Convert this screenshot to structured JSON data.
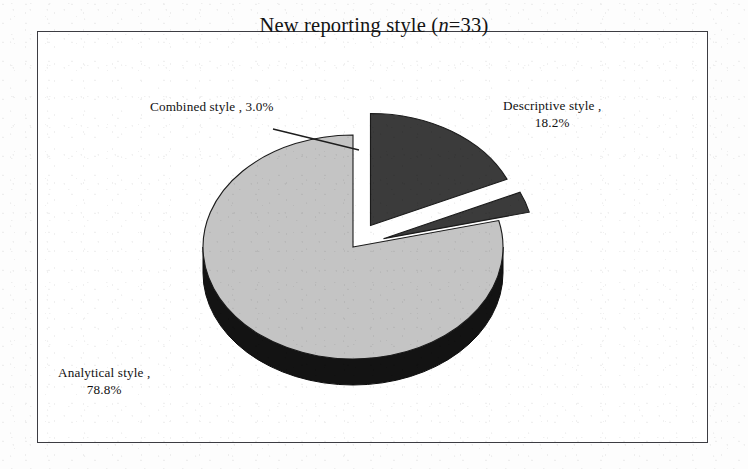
{
  "figure": {
    "title_prefix": "New reporting style (",
    "title_italic": "n",
    "title_suffix": "=33)",
    "title_full": "New reporting style (n=33)",
    "frame_color": "#3c3c42",
    "background": "#ffffff"
  },
  "labels": {
    "combined": "Combined style , 3.0%",
    "descriptive_line1": "Descriptive style ,",
    "descriptive_line2": "18.2%",
    "analytical_line1": "Analytical style ,",
    "analytical_line2": "78.8%"
  },
  "chart_data": {
    "type": "pie",
    "title": "New reporting style (n=33)",
    "sample_size": 33,
    "exploded": true,
    "three_d": true,
    "legend": "none",
    "labels_position": "outside-with-leader",
    "categories": [
      "Descriptive style",
      "Combined style",
      "Analytical style"
    ],
    "values": [
      18.2,
      3.0,
      78.8
    ],
    "counts": [
      6,
      1,
      26
    ],
    "unit": "%",
    "colors": [
      "#3b3b3b",
      "#3b3b3b",
      "#c4c4c4"
    ],
    "side_colors": [
      "#111111",
      "#111111",
      "#131313"
    ],
    "slices": [
      {
        "name": "Descriptive style",
        "value": 18.2,
        "count": 6,
        "color": "#3b3b3b",
        "label": "Descriptive style , 18.2%",
        "exploded": true
      },
      {
        "name": "Combined style",
        "value": 3.0,
        "count": 1,
        "color": "#3b3b3b",
        "label": "Combined style , 3.0%",
        "exploded": true
      },
      {
        "name": "Analytical style",
        "value": 78.8,
        "count": 26,
        "color": "#c4c4c4",
        "label": "Analytical style , 78.8%",
        "exploded": false
      }
    ],
    "total": 100.0
  }
}
